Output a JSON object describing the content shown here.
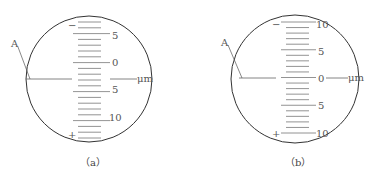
{
  "figures": [
    {
      "id": "a",
      "caption": "（a）",
      "pointer_label": "A",
      "unit": "μm",
      "minus_sign": "−",
      "plus_sign": "+",
      "scale_labels": [
        {
          "text": "5",
          "y": 35
        },
        {
          "text": "0",
          "y": 62
        },
        {
          "text": "5",
          "y": 89
        },
        {
          "text": "10",
          "y": 117
        }
      ]
    },
    {
      "id": "b",
      "caption": "（b）",
      "pointer_label": "A",
      "unit": "μm",
      "minus_sign": "−",
      "plus_sign": "+",
      "scale_labels": [
        {
          "text": "10",
          "y": 24
        },
        {
          "text": "5",
          "y": 51
        },
        {
          "text": "0",
          "y": 78
        },
        {
          "text": "5",
          "y": 105
        },
        {
          "text": "10",
          "y": 133
        }
      ]
    }
  ]
}
